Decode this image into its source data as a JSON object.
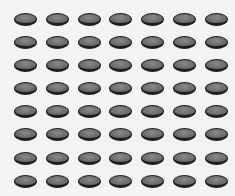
{
  "image": {
    "description": "Grid of dark gray oval discs on a light background",
    "rows": 8,
    "columns": 7,
    "total_items": 56,
    "colors": {
      "background": "#f3f3f3",
      "disc_fill": "#6e6e6e",
      "disc_highlight": "#8a8a8a",
      "disc_border": "#1e1e1e"
    }
  }
}
